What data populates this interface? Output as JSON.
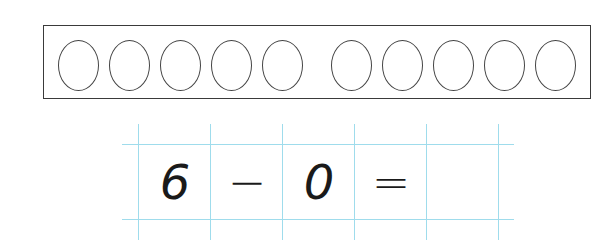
{
  "ten_frame": {
    "total_circles": 10,
    "filled_circles": 0,
    "group_sizes": [
      5,
      5
    ]
  },
  "equation": {
    "cells": [
      "6",
      "−",
      "0",
      "=",
      ""
    ],
    "operand_1": "6",
    "operator": "−",
    "operand_2": "0",
    "equals": "=",
    "answer": ""
  },
  "colors": {
    "grid_line": "#9fdcec",
    "outline": "#3a3a3a"
  }
}
